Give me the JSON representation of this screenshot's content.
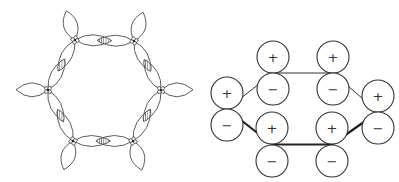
{
  "figure": {
    "left_panel": {
      "description": "Hexagonal ring of sp2-hybrid orbital lobes with hatched sigma-overlap regions between adjacent atoms and outward-pointing C-H lobes",
      "vertices": [
        [
          75,
          40
        ],
        [
          134,
          41
        ],
        [
          161,
          90
        ],
        [
          133,
          141
        ],
        [
          73,
          141
        ],
        [
          48,
          90
        ]
      ],
      "outer_lobe_length": 32,
      "hatched_overlaps": 6
    },
    "right_panel": {
      "description": "Six p-orbitals drawn as pairs of circles with phase signs, connected by bonds",
      "orbital_radius": 16,
      "orbitals": [
        {
          "id": "far-left",
          "x": 227,
          "top": {
            "y": 93,
            "sign": "+"
          },
          "bottom": {
            "y": 125,
            "sign": "−"
          }
        },
        {
          "id": "top-left",
          "x": 273,
          "top": {
            "y": 57,
            "sign": "+"
          },
          "bottom": {
            "y": 89,
            "sign": "−"
          }
        },
        {
          "id": "top-right",
          "x": 333,
          "top": {
            "y": 57,
            "sign": "+"
          },
          "bottom": {
            "y": 89,
            "sign": "−"
          }
        },
        {
          "id": "far-right",
          "x": 378,
          "top": {
            "y": 96,
            "sign": "+"
          },
          "bottom": {
            "y": 128,
            "sign": "−"
          }
        },
        {
          "id": "bottom-right",
          "x": 332,
          "top": {
            "y": 128,
            "sign": "+"
          },
          "bottom": {
            "y": 161,
            "sign": "−"
          }
        },
        {
          "id": "bottom-left",
          "x": 272,
          "top": {
            "y": 128,
            "sign": "+"
          },
          "bottom": {
            "y": 161,
            "sign": "−"
          }
        }
      ],
      "bonds": [
        {
          "from": "far-left",
          "to": "top-left",
          "style": "thin"
        },
        {
          "from": "top-left",
          "to": "top-right",
          "style": "thin"
        },
        {
          "from": "top-right",
          "to": "far-right",
          "style": "thin"
        },
        {
          "from": "far-right",
          "to": "bottom-right",
          "style": "thick"
        },
        {
          "from": "bottom-right",
          "to": "bottom-left",
          "style": "thick"
        },
        {
          "from": "bottom-left",
          "to": "far-left",
          "style": "thick"
        }
      ]
    },
    "signs": {
      "plus": "+",
      "minus": "−"
    }
  }
}
